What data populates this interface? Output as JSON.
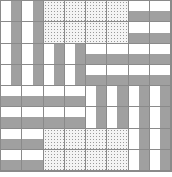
{
  "diagram": {
    "legend": {
      "V": "vertical stripes (white/gray)",
      "H": "horizontal stripes (white/gray)",
      "D": "dotted fill"
    },
    "colors": {
      "stripe": "#a0a0a0",
      "background": "#ffffff",
      "grid_line": "#8a8a8a",
      "dot": "#9a9a9a"
    },
    "grid_size": 8,
    "blocks": [
      [
        "V",
        "D",
        "D",
        "H"
      ],
      [
        "V",
        "V",
        "H",
        "H"
      ],
      [
        "H",
        "H",
        "V",
        "V"
      ],
      [
        "H",
        "D",
        "D",
        "V"
      ]
    ]
  }
}
